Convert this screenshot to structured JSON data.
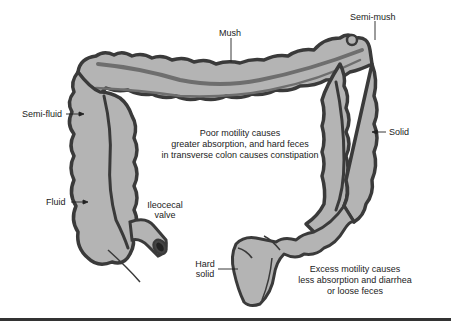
{
  "diagram": {
    "colors": {
      "colon_fill": "#b4b4b4",
      "colon_outline": "#3a3a3a",
      "inner_band": "#6e6e6e",
      "text": "#222222",
      "background": "#ffffff"
    },
    "labels": {
      "mush": "Mush",
      "semi_mush": "Semi-mush",
      "semi_fluid": "Semi-fluid",
      "solid": "Solid",
      "fluid": "Fluid",
      "ileocecal_line1": "Ileocecal",
      "ileocecal_line2": "valve",
      "hard_line1": "Hard",
      "hard_line2": "solid"
    },
    "notes": {
      "poor_motility": {
        "line1": "Poor motility causes",
        "line2": "greater absorption, and hard feces",
        "line3": "in transverse colon causes constipation"
      },
      "excess_motility": {
        "line1": "Excess motility causes",
        "line2": "less absorption and diarrhea",
        "line3": "or loose feces"
      }
    }
  }
}
